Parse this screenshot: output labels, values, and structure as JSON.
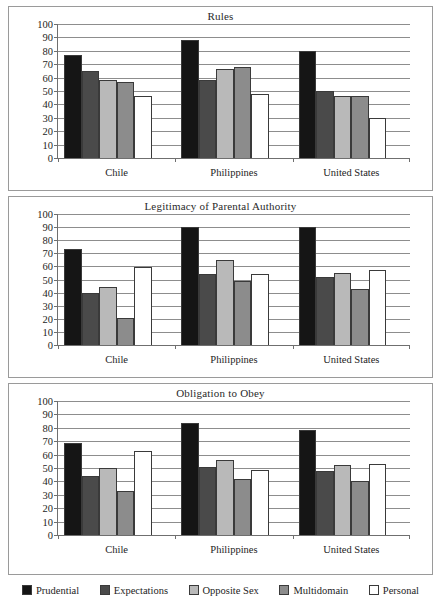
{
  "legend": {
    "items": [
      {
        "label": "Prudential",
        "color": "#151515"
      },
      {
        "label": "Expectations",
        "color": "#4a4a4a"
      },
      {
        "label": "Opposite Sex",
        "color": "#b9b9b9"
      },
      {
        "label": "Multidomain",
        "color": "#8c8c8c"
      },
      {
        "label": "Personal",
        "color": "#ffffff"
      }
    ]
  },
  "axis": {
    "yticks": [
      0,
      10,
      20,
      30,
      40,
      50,
      60,
      70,
      80,
      90,
      100
    ],
    "ymin": 0,
    "ymax": 100,
    "categories": [
      "Chile",
      "Philippines",
      "United States"
    ]
  },
  "chart_data": [
    {
      "type": "bar",
      "title": "Rules",
      "xlabel": "",
      "ylabel": "",
      "ylim": [
        0,
        100
      ],
      "grid": true,
      "legend_position": "bottom",
      "categories": [
        "Chile",
        "Philippines",
        "United States"
      ],
      "series": [
        {
          "name": "Prudential",
          "color": "#151515",
          "values": [
            77,
            88,
            80
          ]
        },
        {
          "name": "Expectations",
          "color": "#4a4a4a",
          "values": [
            65,
            58,
            50
          ]
        },
        {
          "name": "Opposite Sex",
          "color": "#b9b9b9",
          "values": [
            58.5,
            66.5,
            46
          ]
        },
        {
          "name": "Multidomain",
          "color": "#8c8c8c",
          "values": [
            57,
            68,
            46
          ]
        },
        {
          "name": "Personal",
          "color": "#ffffff",
          "values": [
            46,
            48,
            30
          ]
        }
      ]
    },
    {
      "type": "bar",
      "title": "Legitimacy of Parental Authority",
      "xlabel": "",
      "ylabel": "",
      "ylim": [
        0,
        100
      ],
      "grid": true,
      "legend_position": "bottom",
      "categories": [
        "Chile",
        "Philippines",
        "United States"
      ],
      "series": [
        {
          "name": "Prudential",
          "color": "#151515",
          "values": [
            73,
            90,
            90
          ]
        },
        {
          "name": "Expectations",
          "color": "#4a4a4a",
          "values": [
            39.5,
            54.5,
            52
          ]
        },
        {
          "name": "Opposite Sex",
          "color": "#b9b9b9",
          "values": [
            44.5,
            65,
            55
          ]
        },
        {
          "name": "Multidomain",
          "color": "#8c8c8c",
          "values": [
            20.5,
            49,
            42.5
          ]
        },
        {
          "name": "Personal",
          "color": "#ffffff",
          "values": [
            59.5,
            54,
            57
          ]
        }
      ]
    },
    {
      "type": "bar",
      "title": "Obligation to Obey",
      "xlabel": "",
      "ylabel": "",
      "ylim": [
        0,
        100
      ],
      "grid": true,
      "legend_position": "bottom",
      "categories": [
        "Chile",
        "Philippines",
        "United States"
      ],
      "series": [
        {
          "name": "Prudential",
          "color": "#151515",
          "values": [
            69,
            83.5,
            78
          ]
        },
        {
          "name": "Expectations",
          "color": "#4a4a4a",
          "values": [
            44,
            50.5,
            48
          ]
        },
        {
          "name": "Opposite Sex",
          "color": "#b9b9b9",
          "values": [
            50,
            56,
            52.5
          ]
        },
        {
          "name": "Multidomain",
          "color": "#8c8c8c",
          "values": [
            33,
            42,
            40.5
          ]
        },
        {
          "name": "Personal",
          "color": "#ffffff",
          "values": [
            62.5,
            48.5,
            53
          ]
        }
      ]
    }
  ]
}
